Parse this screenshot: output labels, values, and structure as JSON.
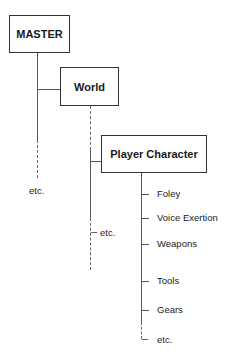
{
  "diagram": {
    "type": "hierarchy-tree",
    "root": {
      "label": "MASTER",
      "trailing_label": "etc.",
      "child": {
        "label": "World",
        "trailing_label": "etc.",
        "child": {
          "label": "Player Character",
          "children": [
            {
              "label": "Foley"
            },
            {
              "label": "Voice Exertion"
            },
            {
              "label": "Weapons"
            },
            {
              "label": "Tools"
            },
            {
              "label": "Gears"
            }
          ],
          "trailing_label": "etc."
        }
      }
    }
  }
}
